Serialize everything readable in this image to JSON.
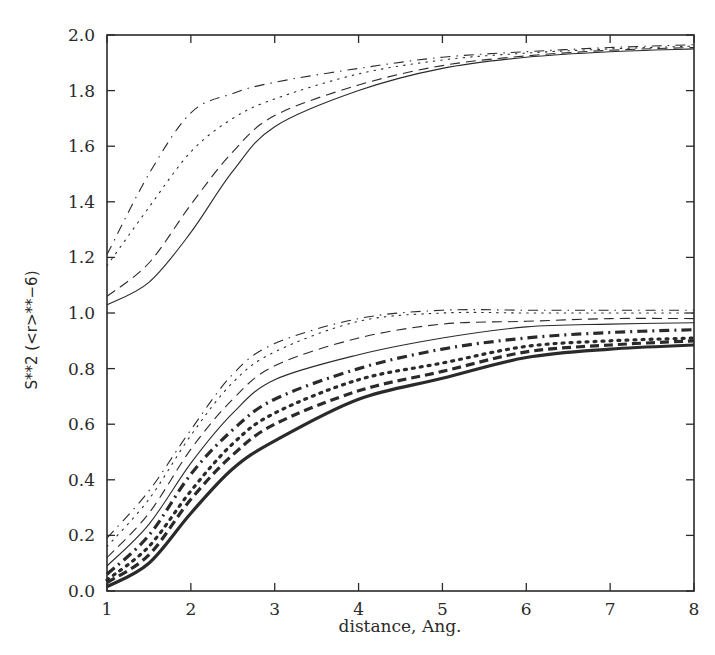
{
  "chart_data": {
    "type": "line",
    "title": "",
    "xlabel": "distance, Ang.",
    "ylabel": "S**2  (<r>**−6)",
    "xlim": [
      1,
      8
    ],
    "ylim": [
      0.0,
      2.0
    ],
    "xticks": [
      "1",
      "2",
      "3",
      "4",
      "5",
      "6",
      "7",
      "8"
    ],
    "yticks": [
      "0.0",
      "0.2",
      "0.4",
      "0.6",
      "0.8",
      "1.0",
      "1.2",
      "1.4",
      "1.6",
      "1.8",
      "2.0"
    ],
    "grid": false,
    "legend": null,
    "x": [
      1,
      1.5,
      2,
      2.5,
      3,
      4,
      5,
      6,
      7,
      8
    ],
    "series": [
      {
        "name": "upper dash-dot",
        "style": "dashdot",
        "weight": "thin",
        "values": [
          1.21,
          1.5,
          1.72,
          1.79,
          1.83,
          1.88,
          1.92,
          1.94,
          1.955,
          1.965
        ]
      },
      {
        "name": "upper dotted",
        "style": "dotted",
        "weight": "thin",
        "values": [
          1.17,
          1.38,
          1.58,
          1.7,
          1.77,
          1.86,
          1.91,
          1.935,
          1.95,
          1.96
        ]
      },
      {
        "name": "upper dashed",
        "style": "dashed",
        "weight": "thin",
        "values": [
          1.06,
          1.18,
          1.39,
          1.58,
          1.71,
          1.82,
          1.89,
          1.925,
          1.945,
          1.955
        ]
      },
      {
        "name": "upper solid",
        "style": "solid",
        "weight": "thin",
        "values": [
          1.03,
          1.11,
          1.29,
          1.51,
          1.67,
          1.8,
          1.88,
          1.92,
          1.94,
          1.95
        ]
      },
      {
        "name": "lower dash-dot",
        "style": "dashdot",
        "weight": "thin",
        "values": [
          0.19,
          0.36,
          0.58,
          0.78,
          0.89,
          0.98,
          1.01,
          1.01,
          1.01,
          1.01
        ]
      },
      {
        "name": "lower dotted",
        "style": "dotted",
        "weight": "thin",
        "values": [
          0.16,
          0.33,
          0.56,
          0.75,
          0.86,
          0.97,
          1.0,
          1.0,
          1.0,
          1.0
        ]
      },
      {
        "name": "lower dashed",
        "style": "dashed",
        "weight": "thin",
        "values": [
          0.12,
          0.28,
          0.51,
          0.69,
          0.81,
          0.91,
          0.96,
          0.97,
          0.98,
          0.98
        ]
      },
      {
        "name": "lower solid",
        "style": "solid",
        "weight": "thin",
        "values": [
          0.09,
          0.24,
          0.46,
          0.64,
          0.76,
          0.85,
          0.91,
          0.95,
          0.96,
          0.965
        ]
      },
      {
        "name": "lower thick dash-dot",
        "style": "dashdot",
        "weight": "thick",
        "values": [
          0.06,
          0.2,
          0.42,
          0.58,
          0.69,
          0.8,
          0.87,
          0.91,
          0.93,
          0.94
        ]
      },
      {
        "name": "lower thick dotted",
        "style": "dotted",
        "weight": "thick",
        "values": [
          0.04,
          0.16,
          0.36,
          0.53,
          0.64,
          0.76,
          0.82,
          0.88,
          0.9,
          0.91
        ]
      },
      {
        "name": "lower thick dashed",
        "style": "dashed",
        "weight": "thick",
        "values": [
          0.03,
          0.13,
          0.33,
          0.49,
          0.6,
          0.72,
          0.79,
          0.86,
          0.885,
          0.9
        ]
      },
      {
        "name": "lower thick solid",
        "style": "solid",
        "weight": "thick",
        "values": [
          0.015,
          0.1,
          0.28,
          0.44,
          0.54,
          0.69,
          0.765,
          0.84,
          0.87,
          0.885
        ]
      }
    ]
  },
  "colors": {
    "line": "#2a2a2a",
    "background": "#ffffff"
  }
}
